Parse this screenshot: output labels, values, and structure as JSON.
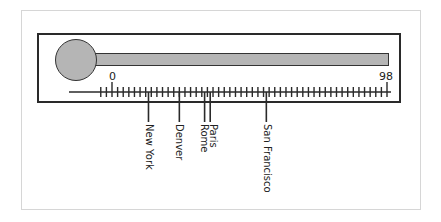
{
  "chart_data": {
    "type": "thermometer-scale",
    "title": "",
    "scale": {
      "min_label": "0",
      "max_label": "98",
      "min": 0,
      "max": 98,
      "tick_step": 2
    },
    "markers": [
      {
        "label": "New York",
        "value": 13
      },
      {
        "label": "Denver",
        "value": 24
      },
      {
        "label": "Rome",
        "value": 33
      },
      {
        "label": "Paris",
        "value": 35
      },
      {
        "label": "San Francisco",
        "value": 55
      }
    ],
    "fill_color": "#b5b5b5",
    "line_color": "#2a2a2a"
  },
  "labels": {
    "min": "0",
    "max": "98",
    "cities": [
      "New York",
      "Denver",
      "Rome",
      "Paris",
      "San Francisco"
    ]
  }
}
